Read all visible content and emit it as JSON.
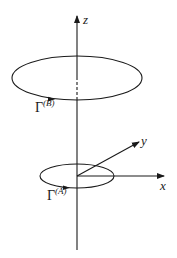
{
  "diagram": {
    "type": "3d-coordinate-axes-with-loops",
    "colors": {
      "ink": "#1a1a1a",
      "background": "#ffffff"
    },
    "axes": {
      "z": {
        "label": "z"
      },
      "x": {
        "label": "x"
      },
      "y": {
        "label": "y"
      }
    },
    "loops": [
      {
        "id": "B",
        "symbol": "Γ",
        "superscript": "(B)",
        "position": "upper, large radius"
      },
      {
        "id": "A",
        "symbol": "Γ",
        "superscript": "(A)",
        "position": "lower, small radius at origin"
      }
    ]
  }
}
